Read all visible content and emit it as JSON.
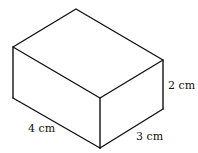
{
  "diagram": {
    "type": "cuboid",
    "vertices": {
      "top_back": [
        76,
        9
      ],
      "top_left": [
        13,
        47
      ],
      "top_right": [
        163,
        60
      ],
      "top_front": [
        100,
        98
      ],
      "bottom_left": [
        13,
        98
      ],
      "bottom_front": [
        100,
        148
      ],
      "bottom_right": [
        163,
        109
      ]
    },
    "labels": {
      "length": "4 cm",
      "width": "3 cm",
      "height": "2 cm"
    },
    "dimensions": {
      "length_cm": 4,
      "width_cm": 3,
      "height_cm": 2
    }
  }
}
